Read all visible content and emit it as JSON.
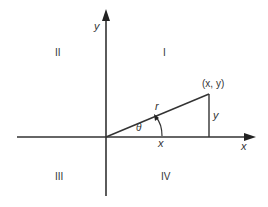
{
  "diagram": {
    "colors": {
      "line": "#333333",
      "background": "#ffffff"
    },
    "axes": {
      "x_label": "x",
      "y_label": "y"
    },
    "quadrants": {
      "q1": "I",
      "q2": "II",
      "q3": "III",
      "q4": "IV"
    },
    "point_label": "(x, y)",
    "radius_label": "r",
    "angle_label": "θ",
    "horizontal_leg_label": "x",
    "vertical_leg_label": "y"
  }
}
